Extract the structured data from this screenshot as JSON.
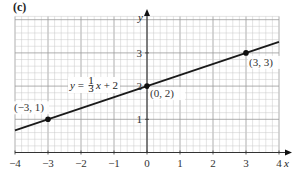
{
  "panel_label": "(c)",
  "chart_data": {
    "type": "line",
    "title": "",
    "xlabel": "x",
    "ylabel": "y",
    "xlim": [
      -4,
      4
    ],
    "ylim": [
      0,
      4.1
    ],
    "grid": true,
    "minor_subdivisions": 5,
    "x_ticks": [
      -4,
      -3,
      -2,
      -1,
      0,
      1,
      2,
      3,
      4
    ],
    "x_tick_labels": [
      "−4",
      "−3",
      "−2",
      "−1",
      "0",
      "1",
      "2",
      "3",
      "4"
    ],
    "y_ticks": [
      1,
      2,
      3
    ],
    "y_tick_labels": [
      "1",
      "2",
      "3"
    ],
    "series": [
      {
        "name": "y = 1/3 x + 2",
        "equation": "y = (1/3)x + 2",
        "slope": 0.3333,
        "intercept": 2,
        "x": [
          -4,
          4
        ],
        "y": [
          0.6667,
          3.3333
        ]
      }
    ],
    "points": [
      {
        "x": -3,
        "y": 1,
        "label": "(−3, 1)"
      },
      {
        "x": 0,
        "y": 2,
        "label": "(0, 2)"
      },
      {
        "x": 3,
        "y": 3,
        "label": "(3, 3)"
      }
    ],
    "annotations": [
      {
        "text": "y = ⅓x + 2",
        "parts": {
          "lhs": "y = ",
          "num": "1",
          "den": "3",
          "rhs": "x + 2"
        }
      }
    ],
    "colors": {
      "line": "#1a1a1a",
      "grid_minor": "#c8c8c8",
      "grid_major": "#9a9a9a",
      "axis": "#333333"
    }
  }
}
